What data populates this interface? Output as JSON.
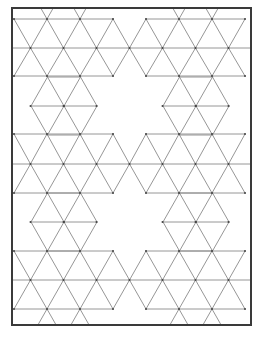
{
  "diagram": {
    "type": "triangle-tessellation-pattern",
    "colors": {
      "frame": "#3a3a3a",
      "edge": "#8a8a8a",
      "vertex": "#444444",
      "background": "#ffffff"
    },
    "frame": {
      "x": 12,
      "y": 8,
      "width": 239,
      "height": 317
    },
    "grid": {
      "side": 33,
      "row_height": 29,
      "x0": 14,
      "y0": 19,
      "half": 16.5
    },
    "horizontal_segments": [
      [
        14,
        19,
        113,
        19
      ],
      [
        146,
        19,
        245,
        19
      ],
      [
        12,
        48,
        251,
        48
      ],
      [
        14,
        76,
        113,
        76
      ],
      [
        146,
        76,
        245,
        76
      ],
      [
        31,
        106,
        97,
        106
      ],
      [
        163,
        106,
        229,
        106
      ],
      [
        14,
        134,
        113,
        134
      ],
      [
        146,
        134,
        245,
        134
      ],
      [
        12,
        164,
        251,
        164
      ],
      [
        14,
        193,
        113,
        193
      ],
      [
        146,
        193,
        245,
        193
      ],
      [
        31,
        222,
        97,
        222
      ],
      [
        163,
        222,
        229,
        222
      ],
      [
        14,
        251,
        113,
        251
      ],
      [
        146,
        251,
        245,
        251
      ],
      [
        12,
        280,
        251,
        280
      ],
      [
        14,
        309,
        113,
        309
      ],
      [
        146,
        309,
        245,
        309
      ]
    ],
    "band_rows": [
      {
        "top": 19,
        "bottom": 48,
        "bottom_odd": true,
        "x_ranges": [
          [
            14,
            130
          ],
          [
            130,
            251
          ]
        ]
      },
      {
        "top": 48,
        "bottom": 76,
        "bottom_odd": false,
        "x_ranges": [
          [
            14,
            130
          ],
          [
            130,
            251
          ]
        ]
      },
      {
        "top": 134,
        "bottom": 164,
        "bottom_odd": true,
        "x_ranges": [
          [
            14,
            251
          ]
        ]
      },
      {
        "top": 164,
        "bottom": 193,
        "bottom_odd": false,
        "x_ranges": [
          [
            14,
            251
          ]
        ]
      },
      {
        "top": 251,
        "bottom": 280,
        "bottom_odd": true,
        "x_ranges": [
          [
            14,
            130
          ],
          [
            130,
            251
          ]
        ]
      },
      {
        "top": 280,
        "bottom": 309,
        "bottom_odd": false,
        "x_ranges": [
          [
            14,
            130
          ],
          [
            130,
            251
          ]
        ]
      }
    ],
    "hex_blocks": [
      {
        "cx": 64,
        "cy": 106
      },
      {
        "cx": 196,
        "cy": 106
      },
      {
        "cx": 64,
        "cy": 222
      },
      {
        "cx": 196,
        "cy": 222
      }
    ],
    "edge_spikes": [
      {
        "x": 47,
        "y": 19,
        "dir": "up"
      },
      {
        "x": 80,
        "y": 19,
        "dir": "up"
      },
      {
        "x": 179,
        "y": 19,
        "dir": "up"
      },
      {
        "x": 212,
        "y": 19,
        "dir": "up"
      },
      {
        "x": 47,
        "y": 309,
        "dir": "down"
      },
      {
        "x": 80,
        "y": 309,
        "dir": "down"
      },
      {
        "x": 179,
        "y": 309,
        "dir": "down"
      },
      {
        "x": 212,
        "y": 309,
        "dir": "down"
      }
    ]
  }
}
